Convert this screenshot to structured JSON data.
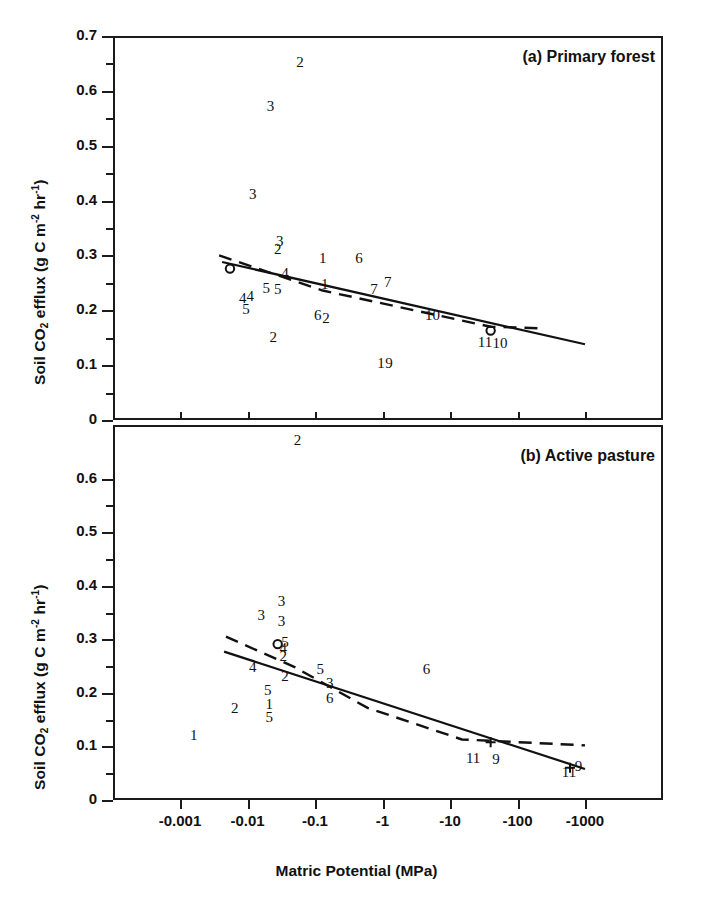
{
  "figure": {
    "xlabel": "Matric Potential (MPa)",
    "ylabel_parts": {
      "p1": "Soil CO",
      "sub1": "2",
      "p2": " efflux (g C m",
      "sup1": "-2",
      "p3": " hr",
      "sup2": "-1",
      "p4": ")"
    },
    "ylabel_plain": "Soil CO2 efflux (g C m-2 hr-1)"
  },
  "chart_data": [
    {
      "type": "scatter",
      "panel_id": "a",
      "title": "(a) Primary forest",
      "xlabel": "Matric Potential (MPa)",
      "ylabel": "Soil CO2 efflux (g C m-2 hr-1)",
      "xscale": "log-negative",
      "xticks": [
        "-0.001",
        "-0.01",
        "-0.1",
        "-1",
        "-10",
        "-100",
        "-1000"
      ],
      "xtick_values": [
        -0.001,
        -0.01,
        -0.1,
        -1,
        -10,
        -100,
        -1000
      ],
      "yticks": [
        "0.7",
        "0.6",
        "0.5",
        "0.4",
        "0.3",
        "0.2",
        "0.1",
        "0"
      ],
      "ytick_values": [
        0.7,
        0.6,
        0.5,
        0.4,
        0.3,
        0.2,
        0.1,
        0
      ],
      "ylim": [
        0,
        0.7
      ],
      "grid": false,
      "legend": "none",
      "marker_style": "numeric-labels",
      "points": [
        {
          "label": "2",
          "x": -0.06,
          "y": 0.652
        },
        {
          "label": "3",
          "x": -0.022,
          "y": 0.572
        },
        {
          "label": "3",
          "x": -0.012,
          "y": 0.412
        },
        {
          "label": "3",
          "x": -0.03,
          "y": 0.326
        },
        {
          "label": "2",
          "x": -0.028,
          "y": 0.312
        },
        {
          "label": "1",
          "x": -0.13,
          "y": 0.295
        },
        {
          "label": "6",
          "x": -0.45,
          "y": 0.295
        },
        {
          "label": "4",
          "x": -0.036,
          "y": 0.268
        },
        {
          "label": "1",
          "x": -0.14,
          "y": 0.248
        },
        {
          "label": "7",
          "x": -1.2,
          "y": 0.252
        },
        {
          "label": "7",
          "x": -0.75,
          "y": 0.238
        },
        {
          "label": "5",
          "x": -0.028,
          "y": 0.238
        },
        {
          "label": "5",
          "x": -0.019,
          "y": 0.24
        },
        {
          "label": "4",
          "x": -0.011,
          "y": 0.226
        },
        {
          "label": "4",
          "x": -0.0085,
          "y": 0.222
        },
        {
          "label": "5",
          "x": -0.0095,
          "y": 0.202
        },
        {
          "label": "6",
          "x": -0.11,
          "y": 0.192
        },
        {
          "label": "2",
          "x": -0.145,
          "y": 0.186
        },
        {
          "label": "10",
          "x": -5.5,
          "y": 0.192
        },
        {
          "label": "2",
          "x": -0.024,
          "y": 0.152
        },
        {
          "label": "11",
          "x": -33,
          "y": 0.142
        },
        {
          "label": "10",
          "x": -55,
          "y": 0.14
        },
        {
          "label": "1",
          "x": -0.95,
          "y": 0.104
        },
        {
          "label": "9",
          "x": -1.25,
          "y": 0.104
        }
      ],
      "lines": [
        {
          "name": "regression-solid",
          "style": "solid",
          "path": [
            [
              -0.0042,
              0.288
            ],
            [
              -1000,
              0.138
            ]
          ]
        },
        {
          "name": "regression-dashed",
          "style": "dashed",
          "path": [
            [
              -0.0038,
              0.3
            ],
            [
              -0.13,
              0.236
            ],
            [
              -40,
              0.17
            ],
            [
              -250,
              0.167
            ]
          ]
        }
      ],
      "markers": [
        {
          "shape": "open-circle",
          "x": -0.0055,
          "y": 0.276
        },
        {
          "shape": "open-circle",
          "x": -40,
          "y": 0.163
        }
      ]
    },
    {
      "type": "scatter",
      "panel_id": "b",
      "title": "(b) Active pasture",
      "xlabel": "Matric Potential (MPa)",
      "ylabel": "Soil CO2 efflux (g C m-2 hr-1)",
      "xscale": "log-negative",
      "xticks": [
        "-0.001",
        "-0.01",
        "-0.1",
        "-1",
        "-10",
        "-100",
        "-1000"
      ],
      "xtick_values": [
        -0.001,
        -0.01,
        -0.1,
        -1,
        -10,
        -100,
        -1000
      ],
      "yticks": [
        "0.6",
        "0.5",
        "0.4",
        "0.3",
        "0.2",
        "0.1",
        "0"
      ],
      "ytick_values": [
        0.6,
        0.5,
        0.4,
        0.3,
        0.2,
        0.1,
        0
      ],
      "ylim": [
        0,
        0.7
      ],
      "grid": false,
      "legend": "none",
      "marker_style": "numeric-labels",
      "points": [
        {
          "label": "2",
          "x": -0.055,
          "y": 0.672
        },
        {
          "label": "3",
          "x": -0.032,
          "y": 0.372
        },
        {
          "label": "3",
          "x": -0.016,
          "y": 0.345
        },
        {
          "label": "3",
          "x": -0.032,
          "y": 0.334
        },
        {
          "label": "5",
          "x": -0.036,
          "y": 0.295
        },
        {
          "label": "4",
          "x": -0.034,
          "y": 0.283
        },
        {
          "label": "2",
          "x": -0.034,
          "y": 0.268
        },
        {
          "label": "4",
          "x": -0.012,
          "y": 0.248
        },
        {
          "label": "5",
          "x": -0.12,
          "y": 0.244
        },
        {
          "label": "6",
          "x": -4.5,
          "y": 0.244
        },
        {
          "label": "2",
          "x": -0.036,
          "y": 0.232
        },
        {
          "label": "3",
          "x": -0.165,
          "y": 0.218
        },
        {
          "label": "5",
          "x": -0.02,
          "y": 0.205
        },
        {
          "label": "6",
          "x": -0.165,
          "y": 0.19
        },
        {
          "label": "1",
          "x": -0.021,
          "y": 0.18
        },
        {
          "label": "2",
          "x": -0.0065,
          "y": 0.172
        },
        {
          "label": "5",
          "x": -0.021,
          "y": 0.155
        },
        {
          "label": "1",
          "x": -0.0016,
          "y": 0.122
        },
        {
          "label": "11",
          "x": -22,
          "y": 0.078
        },
        {
          "label": "9",
          "x": -48,
          "y": 0.077
        },
        {
          "label": "11",
          "x": -580,
          "y": 0.052
        },
        {
          "label": "9",
          "x": -800,
          "y": 0.064
        }
      ],
      "lines": [
        {
          "name": "regression-solid",
          "style": "solid",
          "path": [
            [
              -0.0045,
              0.277
            ],
            [
              -1000,
              0.058
            ]
          ]
        },
        {
          "name": "regression-dashed",
          "style": "dashed",
          "path": [
            [
              -0.0048,
              0.305
            ],
            [
              -0.05,
              0.248
            ],
            [
              -0.6,
              0.172
            ],
            [
              -15,
              0.113
            ],
            [
              -1000,
              0.102
            ]
          ]
        }
      ],
      "markers": [
        {
          "shape": "open-circle",
          "x": -0.028,
          "y": 0.291
        },
        {
          "shape": "cross-tick",
          "x": -40,
          "y": 0.108
        },
        {
          "shape": "cross-tick",
          "x": -600,
          "y": 0.06
        }
      ]
    }
  ]
}
